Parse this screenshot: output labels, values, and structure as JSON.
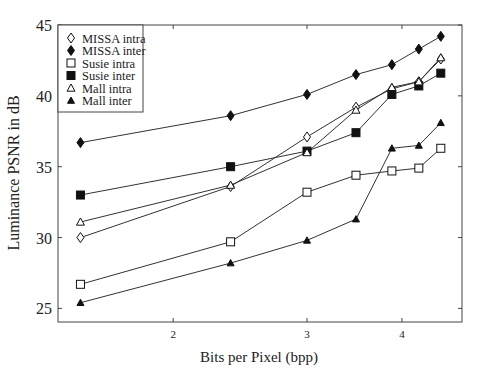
{
  "chart_data": {
    "type": "line",
    "title": "",
    "xlabel": "Bits per Pixel (bpp)",
    "ylabel": "Luminance  PSNR in dB",
    "x_scale": "log",
    "xlim": [
      1.45,
      4.65
    ],
    "ylim": [
      24,
      45
    ],
    "x_ticks": [
      2,
      3,
      4
    ],
    "y_ticks": [
      25,
      30,
      35,
      40,
      45
    ],
    "grid": false,
    "legend_position": "upper left",
    "x": [
      1.51,
      2.38,
      3.0,
      3.48,
      3.88,
      4.21,
      4.5
    ],
    "series": [
      {
        "name": "MISSA intra",
        "marker": "diamond-open",
        "values": [
          30.0,
          33.6,
          37.1,
          39.2,
          40.5,
          41.0,
          42.6
        ]
      },
      {
        "name": "MISSA inter",
        "marker": "diamond-filled",
        "values": [
          36.7,
          38.6,
          40.1,
          41.5,
          42.2,
          43.3,
          44.2
        ]
      },
      {
        "name": "Susie intra",
        "marker": "square-open",
        "values": [
          26.7,
          29.7,
          33.2,
          34.4,
          34.7,
          34.9,
          36.3
        ]
      },
      {
        "name": "Susie inter",
        "marker": "square-filled",
        "values": [
          33.0,
          35.0,
          36.1,
          37.4,
          40.1,
          40.7,
          41.6
        ]
      },
      {
        "name": "Mall intra",
        "marker": "triangle-open",
        "values": [
          31.1,
          33.7,
          36.0,
          39.0,
          40.6,
          41.0,
          42.7
        ]
      },
      {
        "name": "Mall inter",
        "marker": "triangle-filled",
        "values": [
          25.4,
          28.2,
          29.8,
          31.3,
          36.3,
          36.5,
          38.1
        ]
      }
    ]
  },
  "colors": {
    "line": "#333333",
    "axis": "#444444",
    "background": "#ffffff"
  }
}
